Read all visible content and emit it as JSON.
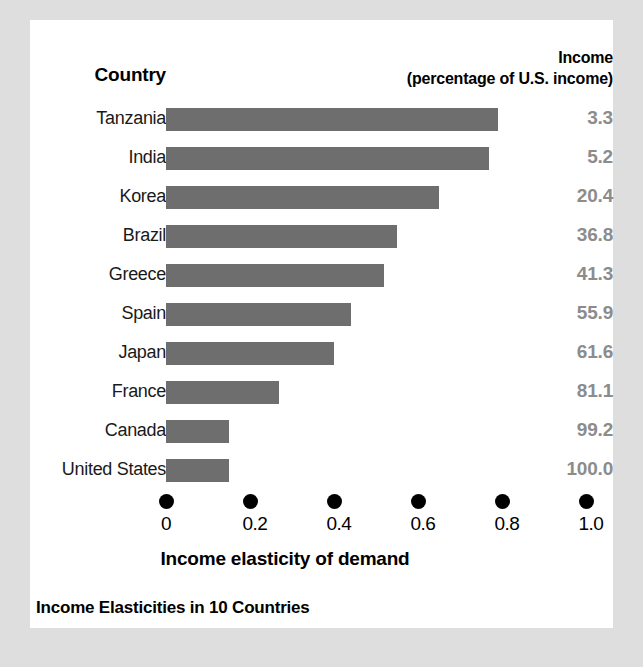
{
  "headers": {
    "country": "Country",
    "income_line1": "Income",
    "income_line2": "(percentage of U.S. income)"
  },
  "colors": {
    "bar": "#6e6e6e",
    "value_text": "#8c8c8c",
    "tick": "#000000",
    "panel": "#ffffff",
    "page": "#dedede"
  },
  "chart_data": {
    "type": "bar",
    "orientation": "horizontal",
    "title": "Income Elasticities in 10 Countries",
    "xlabel": "Income elasticity of demand",
    "ylabel": "Country",
    "xlim": [
      0,
      1.0
    ],
    "grid": false,
    "legend": "none",
    "xticks": [
      "0",
      "0.2",
      "0.4",
      "0.6",
      "0.8",
      "1.0"
    ],
    "xtick_values": [
      0,
      0.2,
      0.4,
      0.6,
      0.8,
      1.0
    ],
    "categories": [
      "Tanzania",
      "India",
      "Korea",
      "Brazil",
      "Greece",
      "Spain",
      "Japan",
      "France",
      "Canada",
      "United States"
    ],
    "values": [
      0.79,
      0.77,
      0.65,
      0.55,
      0.52,
      0.44,
      0.4,
      0.27,
      0.15,
      0.15
    ],
    "series": [
      {
        "name": "Income elasticity of demand",
        "values": [
          0.79,
          0.77,
          0.65,
          0.55,
          0.52,
          0.44,
          0.4,
          0.27,
          0.15,
          0.15
        ]
      },
      {
        "name": "Income (percentage of U.S. income)",
        "values": [
          3.3,
          5.2,
          20.4,
          36.8,
          41.3,
          55.9,
          61.6,
          81.1,
          99.2,
          100.0
        ]
      }
    ],
    "income_labels": [
      "3.3",
      "5.2",
      "20.4",
      "36.8",
      "41.3",
      "55.9",
      "61.6",
      "81.1",
      "99.2",
      "100.0"
    ]
  }
}
